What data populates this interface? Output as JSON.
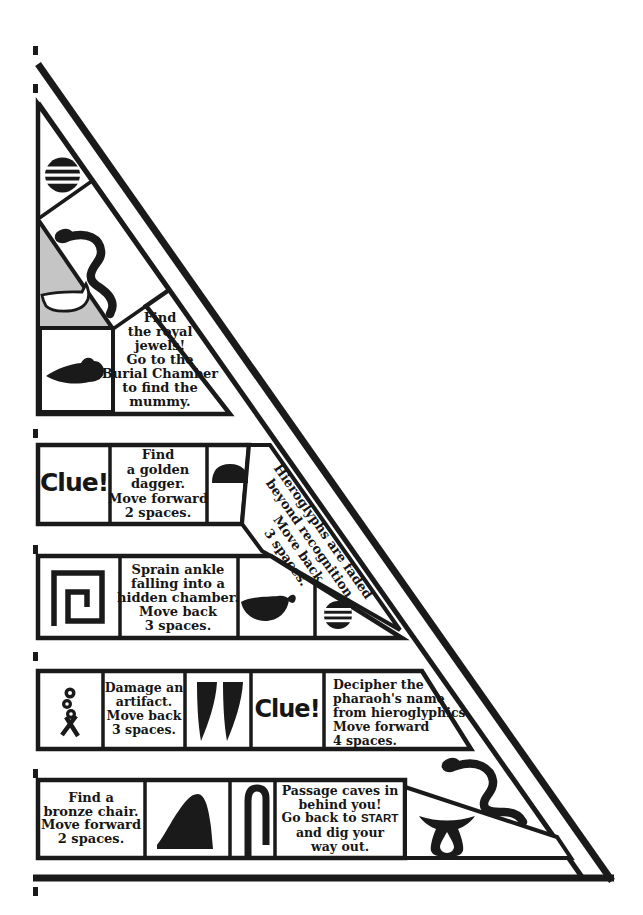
{
  "board": {
    "kind": "pyramid-maze-game-board",
    "colors": {
      "ink": "#1a1a1a",
      "paper": "#ffffff",
      "shade": "#c5c5c5"
    },
    "cells": {
      "royal_jewels": {
        "lines": [
          "Find",
          "the royal",
          "jewels!",
          "Go to the",
          "Burial Chamber",
          "to find the",
          "mummy."
        ]
      },
      "clue_top": {
        "label": "Clue!"
      },
      "golden_dagger": {
        "lines": [
          "Find",
          "a golden",
          "dagger.",
          "Move forward",
          "2 spaces."
        ]
      },
      "hieroglyphs_faded": {
        "lines": [
          "Hieroglyphs are faded",
          "beyond recognition.",
          "Move back",
          "3 spaces."
        ]
      },
      "sprain_ankle": {
        "lines": [
          "Sprain ankle",
          "falling into a",
          "hidden chamber.",
          "Move back",
          "3 spaces."
        ]
      },
      "damage_artifact": {
        "lines": [
          "Damage an",
          "artifact.",
          "Move back",
          "3 spaces."
        ]
      },
      "clue_lower": {
        "label": "Clue!"
      },
      "decipher": {
        "lines": [
          "Decipher the",
          "pharaoh's name",
          "from hieroglyphics.",
          "Move forward",
          "4 spaces."
        ]
      },
      "bronze_chair": {
        "lines": [
          "Find a",
          "bronze chair.",
          "Move forward",
          "2 spaces."
        ]
      },
      "passage": {
        "line1": "Passage caves in",
        "line2": "behind you!",
        "line3_prefix": "Go back to ",
        "start_word": "START",
        "line4": "and dig your",
        "line5": "way out."
      }
    },
    "glyphs": {
      "sieve_top": "sieve-hieroglyph",
      "snake_top": "snake-hieroglyph",
      "boat": "boat-hieroglyph",
      "fish": "fish-hieroglyph",
      "bread_loaf": "bread-loaf-hieroglyph",
      "meander": "meander-spiral-hieroglyph",
      "bowl": "bowl-hieroglyph",
      "sieve_small": "sieve-hieroglyph",
      "twisted_flax": "twisted-flax-hieroglyph",
      "twin_knives": "twin-knives-hieroglyph",
      "hill_slope": "hill-slope-hieroglyph",
      "loop_staff": "loop-staff-hieroglyph",
      "snake_bottom": "snake-hieroglyph",
      "heart_vessel": "heart-vessel-hieroglyph"
    }
  }
}
